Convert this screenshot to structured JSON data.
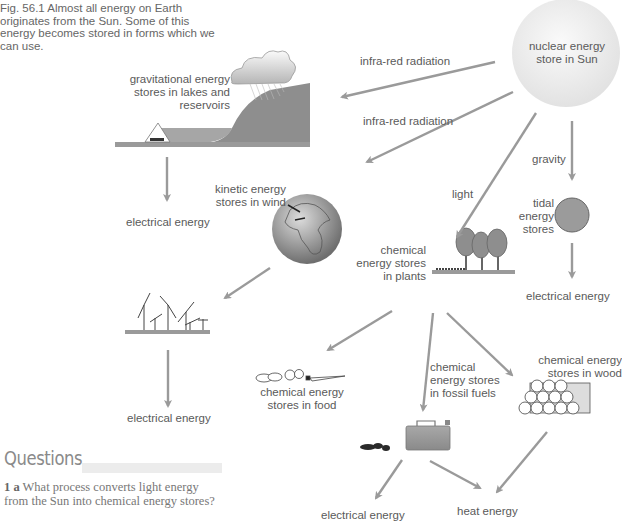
{
  "caption": "Fig. 56.1   Almost all energy on Earth originates from the Sun. Some of this energy becomes stored in forms which we can use.",
  "nodes": {
    "sun": "nuclear energy store in Sun",
    "sun_l1": "nuclear energy",
    "sun_l2": "store in Sun",
    "grav_l1": "gravitational energy",
    "grav_l2": "stores in lakes and",
    "grav_l3": "reservoirs",
    "wind_l1": "kinetic energy",
    "wind_l2": "stores in wind",
    "plants_l1": "chemical",
    "plants_l2": "energy stores",
    "plants_l3": "in plants",
    "tidal_l1": "tidal",
    "tidal_l2": "energy",
    "tidal_l3": "stores",
    "food_l1": "chemical energy",
    "food_l2": "stores in food",
    "fossil_l1": "chemical",
    "fossil_l2": "energy stores",
    "fossil_l3": "in fossil fuels",
    "wood_l1": "chemical energy",
    "wood_l2": "stores in wood"
  },
  "outputs": {
    "elec_hydro": "electrical energy",
    "elec_wind": "electrical energy",
    "elec_tidal": "electrical energy",
    "elec_fossil": "electrical energy",
    "heat": "heat energy"
  },
  "arrow_labels": {
    "ir1": "infra-red radiation",
    "ir2": "infra-red radiation",
    "light": "light",
    "gravity": "gravity"
  },
  "questions": {
    "heading": "Questions",
    "q1_num": "1 a",
    "q1_text": "What process converts light energy from the Sun into chemical energy stores?"
  },
  "colors": {
    "arrow": "#9a9a9a",
    "text": "#5a5a5a"
  }
}
